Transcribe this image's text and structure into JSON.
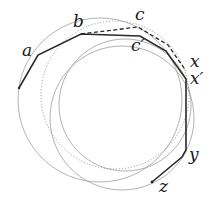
{
  "diagram": {
    "labels": {
      "a": "a",
      "b": "b",
      "c": "c",
      "c_prime": "c′",
      "x": "x",
      "x_prime": "x′",
      "y": "y",
      "z": "z"
    },
    "colors": {
      "polyline": "#2a2a2a",
      "dashed": "#2a2a2a",
      "circle": "#9a9a9a",
      "dotted_circle": "#8a8a8a",
      "background": "#ffffff"
    }
  }
}
